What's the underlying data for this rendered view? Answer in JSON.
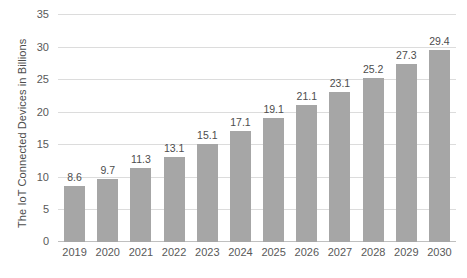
{
  "chart_data": {
    "type": "bar",
    "title": "",
    "xlabel": "",
    "ylabel": "The IoT Connected Devices in Billions",
    "categories": [
      "2019",
      "2020",
      "2021",
      "2022",
      "2023",
      "2024",
      "2025",
      "2026",
      "2027",
      "2028",
      "2029",
      "2030"
    ],
    "values": [
      8.6,
      9.7,
      11.3,
      13.1,
      15.1,
      17.1,
      19.1,
      21.1,
      23.1,
      25.2,
      27.3,
      29.4
    ],
    "value_labels": [
      "8.6",
      "9.7",
      "11.3",
      "13.1",
      "15.1",
      "17.1",
      "19.1",
      "21.1",
      "23.1",
      "25.2",
      "27.3",
      "29.4"
    ],
    "ylim": [
      0,
      35
    ],
    "yticks": [
      0,
      5,
      10,
      15,
      20,
      25,
      30,
      35
    ],
    "ytick_labels": [
      "0",
      "5",
      "10",
      "15",
      "20",
      "25",
      "30",
      "35"
    ],
    "grid": true,
    "legend": false,
    "bar_color": "#a6a6a6",
    "grid_color": "#dcdcdc",
    "text_color": "#595959"
  }
}
